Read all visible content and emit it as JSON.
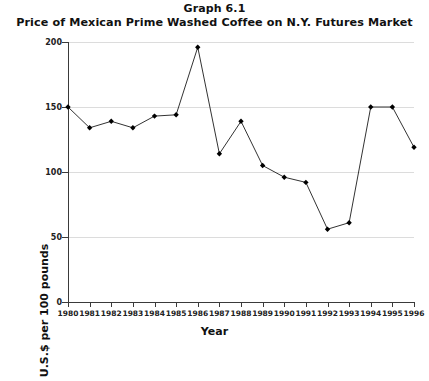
{
  "chart_data": {
    "type": "line",
    "title": "Graph 6.1",
    "subtitle": "Price of Mexican Prime Washed Coffee on N.Y. Futures Market",
    "xlabel": "Year",
    "ylabel": "U.S.$ per 100 pounds",
    "categories": [
      "1980",
      "1981",
      "1982",
      "1983",
      "1984",
      "1985",
      "1986",
      "1987",
      "1988",
      "1989",
      "1990",
      "1991",
      "1992",
      "1993",
      "1994",
      "1995",
      "1996"
    ],
    "values": [
      150,
      134,
      139,
      134,
      143,
      144,
      196,
      114,
      139,
      105,
      96,
      92,
      56,
      61,
      150,
      150,
      119
    ],
    "ylim": [
      0,
      200
    ],
    "yticks": [
      0,
      50,
      100,
      150,
      200
    ],
    "ytick_labels": [
      "0",
      "50",
      "100",
      "150",
      "200"
    ],
    "grid": true,
    "legend": "none",
    "marker": "diamond",
    "line_color": "#333333",
    "marker_color": "#000000",
    "grid_color": "#dcdcdc",
    "background": "#ffffff"
  }
}
